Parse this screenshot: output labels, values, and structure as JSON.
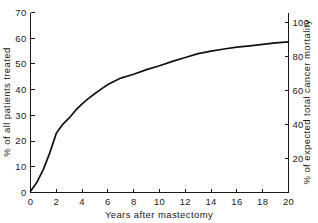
{
  "chart_data": {
    "type": "line",
    "title": "",
    "subtitle": "",
    "xlabel": "Years after mastectomy",
    "ylabel": "% of all patients treated",
    "y2label": "% of expected total cancer mortality",
    "xlim": [
      0,
      20
    ],
    "ylim": [
      0,
      70
    ],
    "y2lim": [
      0,
      106
    ],
    "grid": false,
    "legend": null,
    "legend_position": "none",
    "xticks": [
      0,
      2,
      4,
      6,
      8,
      10,
      12,
      14,
      16,
      18,
      20
    ],
    "xtick_labels": [
      "0",
      "2",
      "4",
      "6",
      "8",
      "10",
      "12",
      "14",
      "16",
      "18",
      "20"
    ],
    "xticks_minor": [
      1,
      3,
      5,
      7,
      9,
      11,
      13,
      15,
      17,
      19
    ],
    "yticks": [
      0,
      10,
      20,
      30,
      40,
      50,
      60,
      70
    ],
    "ytick_labels": [
      "0",
      "10",
      "20",
      "30",
      "40",
      "50",
      "60",
      "70"
    ],
    "y2ticks": [
      20,
      40,
      60,
      80,
      100
    ],
    "y2tick_labels": [
      "20",
      "40",
      "60",
      "80",
      "100"
    ],
    "series": [
      {
        "name": "cumulative percent of all patients treated",
        "color": "#111111",
        "x": [
          0,
          0.5,
          1,
          1.5,
          2,
          2.5,
          3,
          3.5,
          4,
          4.5,
          5,
          5.5,
          6,
          6.5,
          7,
          8,
          9,
          10,
          11,
          12,
          13,
          14,
          15,
          16,
          17,
          18,
          19,
          20
        ],
        "values": [
          0.5,
          4.0,
          9.0,
          15.5,
          23.0,
          26.5,
          29.0,
          32.0,
          34.5,
          36.6,
          38.5,
          40.3,
          42.0,
          43.3,
          44.5,
          46.0,
          47.8,
          49.3,
          51.0,
          52.5,
          54.0,
          55.0,
          55.8,
          56.5,
          57.0,
          57.6,
          58.2,
          58.6
        ]
      }
    ]
  },
  "axes": {
    "left": {
      "title": "% of all patients treated",
      "ticks": [
        "0",
        "10",
        "20",
        "30",
        "40",
        "50",
        "60",
        "70"
      ]
    },
    "right": {
      "title": "% of expected total cancer mortality",
      "ticks": [
        "20",
        "40",
        "60",
        "80",
        "100"
      ]
    },
    "bottom": {
      "title": "Years after mastectomy",
      "ticks": [
        "0",
        "2",
        "4",
        "6",
        "8",
        "10",
        "12",
        "14",
        "16",
        "18",
        "20"
      ]
    }
  }
}
